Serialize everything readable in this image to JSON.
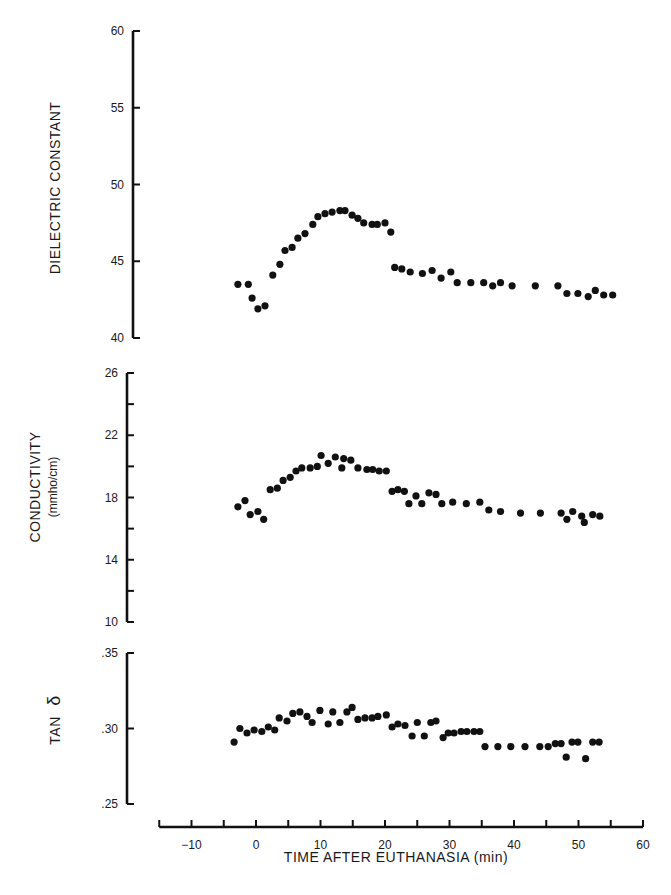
{
  "chart_data": [
    {
      "type": "scatter",
      "panel": "top",
      "title": "",
      "xlabel": "TIME AFTER EUTHANASIA (min)",
      "ylabel": "DIELECTRIC CONSTANT",
      "ylim": [
        40,
        60
      ],
      "yticks": [
        40,
        45,
        50,
        55,
        60
      ],
      "ytick_labels": [
        "40",
        "45",
        "50",
        "55",
        "60"
      ],
      "xlim": [
        -15,
        60
      ],
      "grid": false,
      "x": [
        -2.8,
        -1.2,
        -0.6,
        0.3,
        1.4,
        2.6,
        3.7,
        4.5,
        5.6,
        6.5,
        7.6,
        8.8,
        9.6,
        10.7,
        11.8,
        13.0,
        13.8,
        14.9,
        15.8,
        16.7,
        18.0,
        18.8,
        20.0,
        20.9,
        21.5,
        22.6,
        23.9,
        25.8,
        27.3,
        28.7,
        30.2,
        31.2,
        33.3,
        35.3,
        36.7,
        37.9,
        39.7,
        43.3,
        46.8,
        48.2,
        49.9,
        51.5,
        52.6,
        53.9,
        55.3
      ],
      "y": [
        43.5,
        43.5,
        42.6,
        41.9,
        42.1,
        44.1,
        44.8,
        45.7,
        45.9,
        46.5,
        46.8,
        47.4,
        47.9,
        48.1,
        48.2,
        48.3,
        48.3,
        48.0,
        47.8,
        47.5,
        47.4,
        47.4,
        47.5,
        46.9,
        44.6,
        44.5,
        44.3,
        44.2,
        44.4,
        43.9,
        44.3,
        43.6,
        43.6,
        43.6,
        43.4,
        43.6,
        43.4,
        43.4,
        43.4,
        42.9,
        42.9,
        42.7,
        43.1,
        42.8,
        42.8
      ]
    },
    {
      "type": "scatter",
      "panel": "middle",
      "ylabel": "CONDUCTIVITY",
      "ylabel_units": "(mmho/cm)",
      "ylim": [
        10,
        26
      ],
      "yticks": [
        10,
        12,
        14,
        16,
        18,
        20,
        22,
        24,
        26
      ],
      "ytick_labels": [
        "10",
        "",
        "14",
        "",
        "18",
        "",
        "22",
        "",
        "26"
      ],
      "xlim": [
        -15,
        60
      ],
      "grid": false,
      "x": [
        -2.8,
        -1.7,
        -0.9,
        0.3,
        1.2,
        2.2,
        3.3,
        4.2,
        5.3,
        6.2,
        7.1,
        8.4,
        9.5,
        10.1,
        11.2,
        12.3,
        13.3,
        13.6,
        14.7,
        15.8,
        17.2,
        18.1,
        19.1,
        20.2,
        21.1,
        22.0,
        23.0,
        23.7,
        24.8,
        25.7,
        26.8,
        27.9,
        28.8,
        30.5,
        32.6,
        34.7,
        36.1,
        37.9,
        41.0,
        44.1,
        47.3,
        48.2,
        49.1,
        50.5,
        50.9,
        52.2,
        53.3
      ],
      "y": [
        17.4,
        17.8,
        16.9,
        17.1,
        16.6,
        18.5,
        18.6,
        19.1,
        19.3,
        19.7,
        19.9,
        19.9,
        20.0,
        20.7,
        20.2,
        20.6,
        19.9,
        20.5,
        20.4,
        19.9,
        19.8,
        19.8,
        19.7,
        19.7,
        18.4,
        18.5,
        18.4,
        17.6,
        18.1,
        17.6,
        18.3,
        18.2,
        17.6,
        17.7,
        17.6,
        17.7,
        17.2,
        17.1,
        17.0,
        17.0,
        17.0,
        16.6,
        17.1,
        16.8,
        16.4,
        16.9,
        16.8
      ]
    },
    {
      "type": "scatter",
      "panel": "bottom",
      "ylabel": "TAN δ",
      "ylim": [
        0.25,
        0.35
      ],
      "yticks": [
        0.25,
        0.3,
        0.35
      ],
      "ytick_labels": [
        ".25",
        ".30",
        ".35"
      ],
      "xlim": [
        -15,
        60
      ],
      "xticks": [
        -15,
        -10,
        -5,
        0,
        5,
        10,
        15,
        20,
        25,
        30,
        35,
        40,
        45,
        50,
        55,
        60
      ],
      "xtick_labels": [
        "",
        "-10",
        "",
        "0",
        "",
        "10",
        "",
        "20",
        "",
        "30",
        "",
        "40",
        "",
        "50",
        "",
        "60"
      ],
      "xlabel": "TIME AFTER EUTHANASIA (min)",
      "grid": false,
      "x": [
        -3.4,
        -2.5,
        -1.4,
        -0.3,
        0.9,
        1.9,
        2.9,
        3.6,
        4.8,
        5.7,
        6.8,
        7.9,
        8.7,
        9.9,
        11.2,
        11.9,
        13.0,
        14.1,
        14.9,
        15.8,
        16.9,
        18.0,
        18.9,
        20.2,
        21.1,
        22.0,
        23.1,
        24.2,
        25.0,
        26.1,
        27.1,
        27.9,
        29.0,
        29.8,
        30.7,
        31.8,
        32.7,
        33.8,
        34.7,
        35.5,
        37.5,
        39.5,
        41.7,
        44.0,
        45.3,
        46.4,
        47.3,
        48.1,
        49.0,
        49.9,
        51.1,
        52.2,
        53.2
      ],
      "y": [
        0.291,
        0.3,
        0.297,
        0.299,
        0.298,
        0.301,
        0.299,
        0.307,
        0.305,
        0.31,
        0.311,
        0.308,
        0.304,
        0.312,
        0.303,
        0.311,
        0.304,
        0.311,
        0.314,
        0.306,
        0.307,
        0.307,
        0.308,
        0.309,
        0.301,
        0.303,
        0.302,
        0.295,
        0.304,
        0.295,
        0.304,
        0.305,
        0.294,
        0.297,
        0.297,
        0.298,
        0.298,
        0.298,
        0.298,
        0.288,
        0.288,
        0.288,
        0.288,
        0.288,
        0.288,
        0.29,
        0.29,
        0.281,
        0.291,
        0.291,
        0.28,
        0.291,
        0.291
      ]
    }
  ],
  "labels": {
    "panel_top_ylabel": "DIELECTRIC   CONSTANT",
    "panel_mid_ylabel": "CONDUCTIVITY",
    "panel_mid_units": "(mmho/cm)",
    "panel_bot_ylabel_prefix": "TAN",
    "panel_bot_ylabel_symbol": "δ",
    "xlabel": "TIME AFTER EUTHANASIA (min)"
  },
  "colors": {
    "ink": "#111111",
    "background": "#ffffff"
  }
}
